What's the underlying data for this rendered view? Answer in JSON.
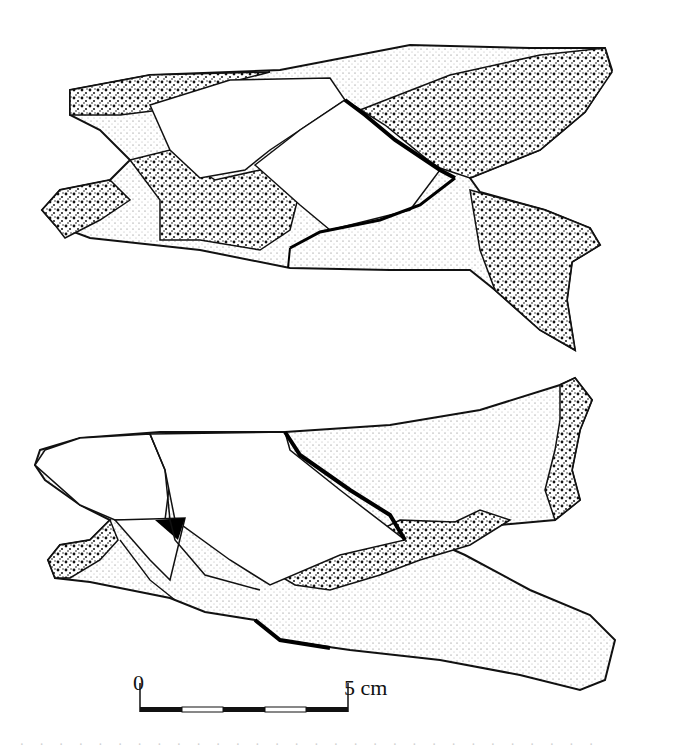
{
  "figure": {
    "views": [
      {
        "name": "upper-view"
      },
      {
        "name": "lower-view"
      }
    ],
    "scale_bar": {
      "start_label": "0",
      "end_label": "5 cm",
      "segments": 5,
      "pattern": [
        "black",
        "white",
        "black",
        "white",
        "black"
      ]
    },
    "caption": "· · · · · · · · · · · · · · · · · · · · · · · · · · · · · ·"
  }
}
